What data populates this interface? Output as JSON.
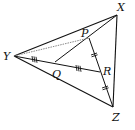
{
  "diagram": {
    "type": "geometry",
    "points": {
      "X": {
        "label": "X",
        "x": 117,
        "y": 15
      },
      "Y": {
        "label": "Y",
        "x": 14,
        "y": 56
      },
      "Z": {
        "label": "Z",
        "x": 113,
        "y": 107
      },
      "P": {
        "label": "P",
        "x": 89,
        "y": 38
      },
      "Q": {
        "label": "Q",
        "x": 55,
        "y": 62
      },
      "R": {
        "label": "R",
        "x": 100,
        "y": 72
      }
    },
    "segments": [
      "XY",
      "YZ",
      "XZ",
      "PZ",
      "YR",
      "QX",
      "YP"
    ],
    "tick_marks": {
      "YQ": "triple",
      "QR": "triple",
      "PR": "double",
      "RZ": "double"
    },
    "colors": {
      "line": "#111111",
      "dotted": "#888888"
    }
  }
}
